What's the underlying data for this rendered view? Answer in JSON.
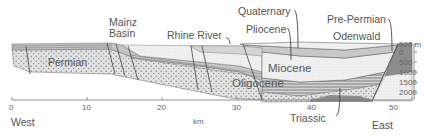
{
  "figure": {
    "type": "geological-cross-section",
    "labels": {
      "mainz_basin_line1": "Mainz",
      "mainz_basin_line2": "Basin",
      "rhine_river": "Rhine River",
      "quaternary": "Quaternary",
      "pliocene": "Pliocene",
      "pre_permian": "Pre-Permian",
      "odenwald": "Odenwald",
      "permian": "Permian",
      "miocene": "Miocene",
      "oligocene": "Oligocene",
      "triassic": "Triassic"
    },
    "x_axis": {
      "unit": "km",
      "ticks": [
        "0",
        "10",
        "20",
        "30",
        "40",
        "50"
      ],
      "left_label": "West",
      "right_label": "East"
    },
    "depth_axis": {
      "ticks": [
        "500 m",
        "0",
        "500",
        "1000",
        "1500",
        "2000"
      ]
    },
    "colors": {
      "permian_fill": "#d9d9d9",
      "dot_pattern": "#888888",
      "light_layer": "#eeeeee",
      "mid_gray": "#bdbdbd",
      "dark_gray": "#8c8c8c",
      "line": "#555555"
    }
  }
}
